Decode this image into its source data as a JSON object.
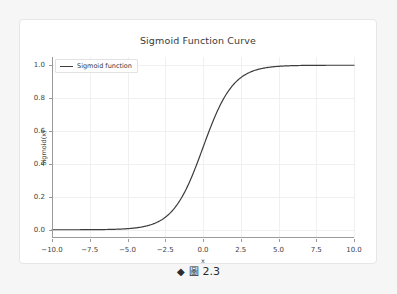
{
  "figure": {
    "title": "Sigmoid Function Curve",
    "legend": {
      "entries": [
        "Sigmoid function"
      ],
      "position": "upper left"
    }
  },
  "caption": {
    "diamond_icon": "◆",
    "figure_glyph": "圖",
    "number": "2.3"
  },
  "colors": {
    "page_background": "#f6f6f7",
    "card_background": "#ffffff",
    "card_border": "#e6e6e8",
    "curve": "#3c3c3c",
    "grid": "#f0f0f1",
    "spine": "#9a9a9a",
    "text": "#3a3a3a"
  },
  "chart_data": {
    "type": "line",
    "title": "Sigmoid Function Curve",
    "xlabel": "x",
    "ylabel": "Sigmoid(x)",
    "xlim": [
      -10,
      10
    ],
    "ylim": [
      -0.05,
      1.05
    ],
    "xticks": [
      -10.0,
      -7.5,
      -5.0,
      -2.5,
      0.0,
      2.5,
      5.0,
      7.5,
      10.0
    ],
    "xticklabels": [
      "−10.0",
      "−7.5",
      "−5.0",
      "−2.5",
      "0.0",
      "2.5",
      "5.0",
      "7.5",
      "10.0"
    ],
    "yticks": [
      0.0,
      0.2,
      0.4,
      0.6,
      0.8,
      1.0
    ],
    "yticklabels": [
      "0.0",
      "0.2",
      "0.4",
      "0.6",
      "0.8",
      "1.0"
    ],
    "grid": true,
    "legend": [
      "Sigmoid function"
    ],
    "legend_position": "upper left",
    "series": [
      {
        "name": "Sigmoid function",
        "formula": "1 / (1 + exp(-x))",
        "color": "#3c3c3c",
        "linewidth": 1.2,
        "x": [
          -10.0,
          -9.5,
          -9.0,
          -8.5,
          -8.0,
          -7.5,
          -7.0,
          -6.5,
          -6.0,
          -5.5,
          -5.0,
          -4.5,
          -4.0,
          -3.5,
          -3.0,
          -2.5,
          -2.0,
          -1.5,
          -1.0,
          -0.5,
          0.0,
          0.5,
          1.0,
          1.5,
          2.0,
          2.5,
          3.0,
          3.5,
          4.0,
          4.5,
          5.0,
          5.5,
          6.0,
          6.5,
          7.0,
          7.5,
          8.0,
          8.5,
          9.0,
          9.5,
          10.0
        ],
        "y": [
          0.0,
          0.0001,
          0.0001,
          0.0002,
          0.0003,
          0.0006,
          0.0009,
          0.0015,
          0.0025,
          0.0041,
          0.0067,
          0.011,
          0.018,
          0.0293,
          0.0474,
          0.0759,
          0.1192,
          0.1824,
          0.2689,
          0.3775,
          0.5,
          0.6225,
          0.7311,
          0.8176,
          0.8808,
          0.9241,
          0.9526,
          0.9707,
          0.982,
          0.989,
          0.9933,
          0.9959,
          0.9975,
          0.9985,
          0.9991,
          0.9994,
          0.9997,
          0.9998,
          0.9999,
          0.9999,
          1.0
        ]
      }
    ]
  }
}
